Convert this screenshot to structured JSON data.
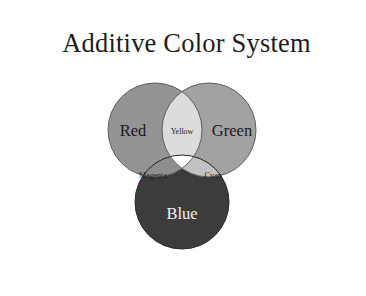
{
  "figure": {
    "title": "Additive Color System",
    "background_color": "#ffffff",
    "frame_color": "#2a2a2a"
  },
  "chart_data": {
    "type": "diagram",
    "subtype": "venn-3-circle",
    "title": "Additive Color System",
    "rendering": "grayscale",
    "sets": [
      {
        "name": "Red",
        "label": "Red",
        "fill": "#949494",
        "stroke": "#5f5f5f",
        "label_color": "#1a1a1a",
        "cx": 130,
        "cy": 118,
        "r": 47
      },
      {
        "name": "Green",
        "label": "Green",
        "fill": "#a2a2a2",
        "stroke": "#5f5f5f",
        "label_color": "#1a1a1a",
        "cx": 184,
        "cy": 118,
        "r": 47
      },
      {
        "name": "Blue",
        "label": "Blue",
        "fill": "#3c3c3c",
        "stroke": "#2b2b2b",
        "label_color": "#f2f2f2",
        "cx": 157,
        "cy": 190,
        "r": 47
      }
    ],
    "intersections": [
      {
        "name": "Yellow",
        "label": "Yellow",
        "of": [
          "Red",
          "Green"
        ],
        "fill": "#dcdcdc",
        "label_color": "#1f1f1f"
      },
      {
        "name": "Magenta",
        "label": "Magenta",
        "of": [
          "Red",
          "Blue"
        ],
        "fill": "#8e8e8e",
        "label_color": "#1f1f1f"
      },
      {
        "name": "Cyan",
        "label": "Cyan",
        "of": [
          "Green",
          "Blue"
        ],
        "fill": "#c2c2c2",
        "label_color": "#1f1f1f"
      },
      {
        "name": "White",
        "label": "",
        "of": [
          "Red",
          "Green",
          "Blue"
        ],
        "fill": "#ffffff",
        "label_color": "#1f1f1f"
      }
    ],
    "labels": {
      "red": "Red",
      "green": "Green",
      "blue": "Blue",
      "yellow": "Yellow",
      "magenta": "Magenta",
      "cyan": "Cyan"
    }
  }
}
